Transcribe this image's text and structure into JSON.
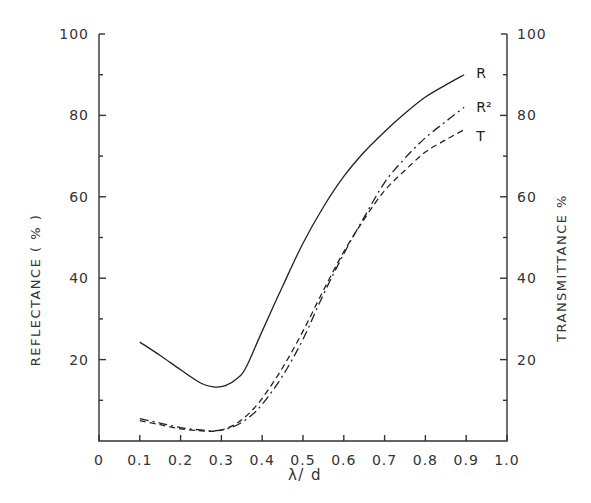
{
  "chart_data": {
    "type": "line",
    "title": "",
    "xlabel": "λ/ d",
    "ylabel": "REFLECTANCE ( % )",
    "ylabel_right": "TRANSMITTANCE %",
    "xlim": [
      0,
      1.0
    ],
    "ylim": [
      0,
      100
    ],
    "ylim_right": [
      0,
      100
    ],
    "grid": false,
    "x_ticks": [
      "0",
      "0.1",
      "0.2",
      "0.3",
      "0.4",
      "0.5",
      "0.6",
      "0.7",
      "0.8",
      "0.9",
      "1.0"
    ],
    "y_ticks_left": [
      "20",
      "40",
      "60",
      "80",
      "100"
    ],
    "y_ticks_right": [
      "20",
      "40",
      "60",
      "80",
      "100"
    ],
    "series": [
      {
        "name": "R",
        "style": "solid",
        "x": [
          0.1,
          0.15,
          0.2,
          0.25,
          0.28,
          0.31,
          0.34,
          0.36,
          0.4,
          0.45,
          0.5,
          0.55,
          0.6,
          0.65,
          0.7,
          0.75,
          0.8,
          0.85,
          0.895
        ],
        "values": [
          24.3,
          21,
          17.5,
          14.2,
          13.3,
          13.6,
          15.5,
          18,
          27,
          38,
          48.6,
          57.5,
          65,
          71,
          76,
          80.5,
          84.5,
          87.5,
          90
        ]
      },
      {
        "name": "R²",
        "style": "dash-dot",
        "x": [
          0.1,
          0.15,
          0.2,
          0.25,
          0.28,
          0.31,
          0.34,
          0.37,
          0.4,
          0.45,
          0.5,
          0.55,
          0.6,
          0.65,
          0.7,
          0.75,
          0.8,
          0.85,
          0.895
        ],
        "values": [
          5.5,
          4.4,
          3.3,
          2.7,
          2.5,
          2.9,
          4.0,
          6.0,
          9.0,
          16,
          25,
          36,
          46,
          55,
          63.5,
          69.5,
          74.5,
          78.5,
          82
        ]
      },
      {
        "name": "T",
        "style": "dashed",
        "x": [
          0.1,
          0.15,
          0.2,
          0.25,
          0.28,
          0.31,
          0.34,
          0.37,
          0.4,
          0.45,
          0.5,
          0.55,
          0.6,
          0.65,
          0.7,
          0.75,
          0.8,
          0.85,
          0.895
        ],
        "values": [
          5.0,
          4.0,
          3.0,
          2.5,
          2.4,
          3.0,
          4.5,
          7.0,
          10.5,
          18,
          27,
          37,
          46.5,
          54.5,
          61.5,
          66.5,
          71,
          74,
          76.5
        ]
      }
    ]
  }
}
